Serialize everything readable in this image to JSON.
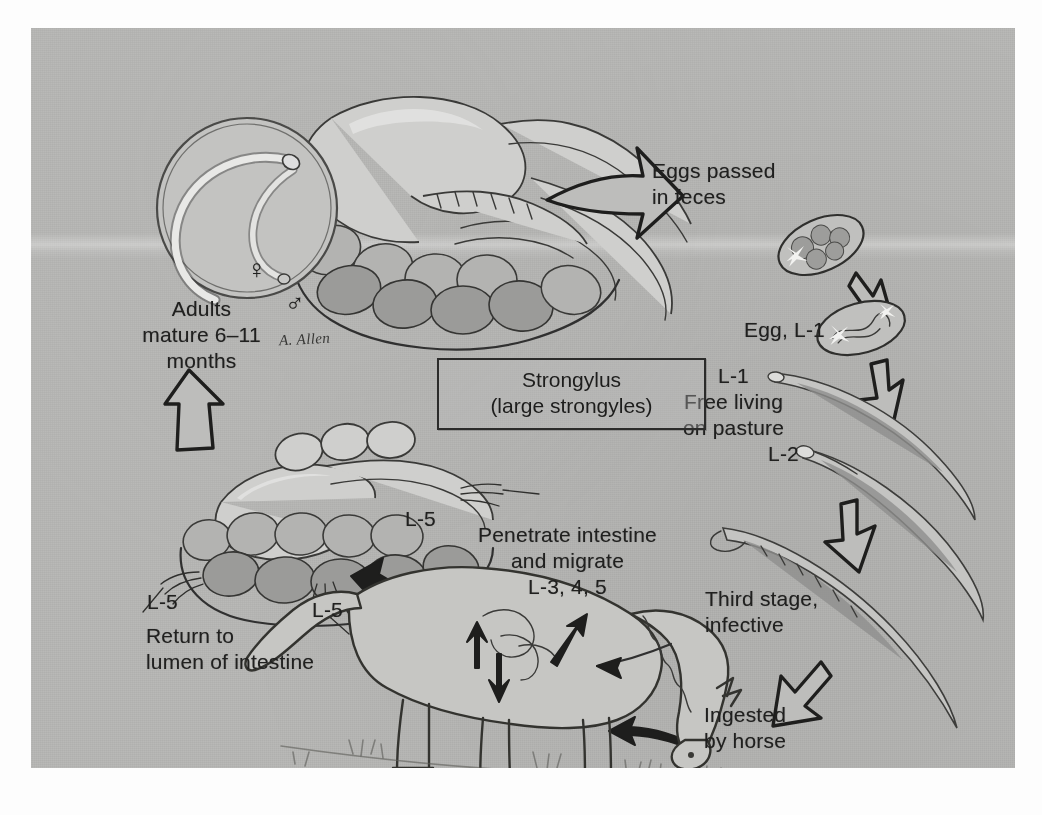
{
  "figure": {
    "artist_signature": "A. Allen",
    "plate_background_color": "#b9b9b7",
    "ink_color": "#2a2a28",
    "page_background_color": "#fdfdfd"
  },
  "caption_box": {
    "line1": "Strongylus",
    "line2": "(large strongyles)"
  },
  "labels": {
    "eggs_passed": "Eggs passed\nin feces",
    "egg_l1": "Egg, L-1",
    "l1_free_living": "L-1\nFree living\non pasture",
    "l2": "L-2",
    "third_stage": "Third stage,\ninfective",
    "ingested": "Ingested\nby horse",
    "penetrate": "Penetrate intestine\nand migrate\nL-3, 4, 5",
    "return_to_lumen": "Return to\nlumen of intestine",
    "l5_right": "L-5",
    "l5_lower_left": "L-5",
    "l5_lower_mid": "L-5",
    "adults_mature": "Adults\nmature 6–11\nmonths"
  },
  "sex_symbols": {
    "female": "♀",
    "male": "♂"
  },
  "icons": {
    "arrow_right_eggs": "arrow-right-icon",
    "arrow_down_egg_to_l1": "arrow-down-icon",
    "arrow_down_l1_to_l2": "arrow-down-icon",
    "arrow_down_l2_to_l3": "arrow-down-icon",
    "arrow_down_left_ingested": "arrow-down-left-icon",
    "arrow_curve_to_mouth": "arrow-curved-left-icon",
    "arrow_left_to_intestine": "arrow-left-icon",
    "arrow_up_adults": "arrow-up-icon"
  },
  "illustrations": {
    "adult_worm_inset": "adult-strongyles-in-cecum-circle-inset",
    "horse_gut_upper": "horse-large-intestine-cecum-drawing",
    "horse_gut_lower": "horse-large-intestine-lumen-drawing",
    "grazing_horse": "grazing-horse-with-migration-arrows",
    "egg_morula": "strongyle-egg-morula",
    "egg_l1": "strongyle-egg-with-l1-larva",
    "larva_l1": "first-stage-larva",
    "larva_l2": "second-stage-larva",
    "larva_l3": "third-stage-infective-larva"
  }
}
